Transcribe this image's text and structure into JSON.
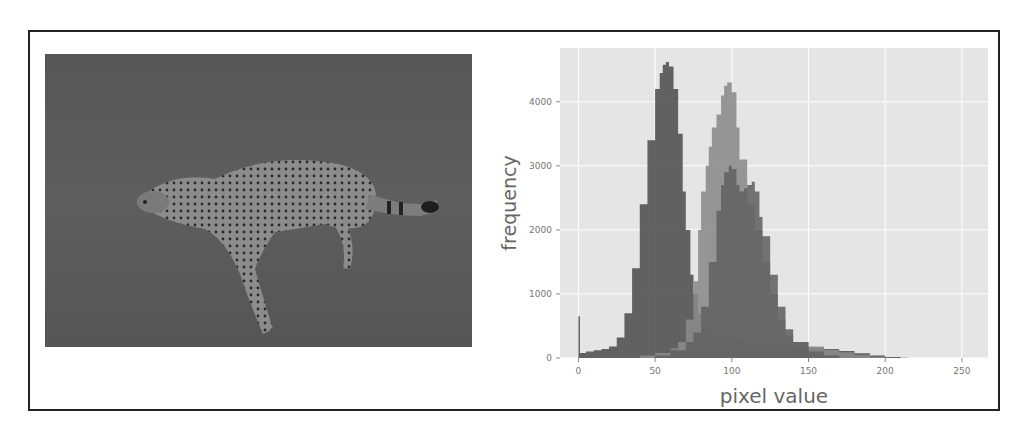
{
  "figure": {
    "left_panel": {
      "type": "photo",
      "subject": "cheetah running on grassland (grayscale)"
    },
    "right_panel": {
      "type": "histogram"
    }
  },
  "chart_data": {
    "type": "area",
    "title": "",
    "xlabel": "pixel value",
    "ylabel": "frequency",
    "xlim": [
      -12,
      267
    ],
    "ylim": [
      0,
      4840
    ],
    "xticks": [
      0,
      50,
      100,
      150,
      200,
      250
    ],
    "yticks": [
      0,
      1000,
      2000,
      3000,
      4000
    ],
    "grid": true,
    "legend": null,
    "background": "#e5e5e5",
    "series": [
      {
        "name": "channel-dark",
        "color": "#4e4e4e",
        "x": [
          0,
          1,
          5,
          10,
          15,
          20,
          25,
          30,
          35,
          40,
          45,
          50,
          53,
          55,
          57,
          59,
          62,
          65,
          68,
          70,
          73,
          75,
          78,
          80,
          85,
          90,
          95,
          100,
          110,
          120,
          130,
          140,
          150,
          160,
          170,
          180,
          190,
          200,
          210,
          215
        ],
        "values": [
          650,
          80,
          100,
          120,
          140,
          180,
          320,
          700,
          1400,
          2400,
          3400,
          4200,
          4450,
          4580,
          4620,
          4550,
          4200,
          3500,
          2600,
          2000,
          1300,
          1000,
          700,
          560,
          420,
          360,
          320,
          290,
          240,
          210,
          190,
          175,
          160,
          140,
          110,
          75,
          40,
          15,
          5,
          0
        ]
      },
      {
        "name": "channel-light",
        "color": "#8a8a8a",
        "x": [
          30,
          40,
          50,
          60,
          65,
          70,
          75,
          78,
          80,
          83,
          85,
          87,
          90,
          93,
          95,
          97,
          100,
          103,
          105,
          110,
          115,
          120,
          125,
          130,
          135,
          140,
          150,
          160,
          170,
          180,
          190,
          200
        ],
        "values": [
          0,
          40,
          80,
          150,
          250,
          600,
          1200,
          2000,
          2600,
          3000,
          3300,
          3600,
          3800,
          4100,
          4250,
          4300,
          4150,
          3600,
          3100,
          2400,
          2000,
          1500,
          1000,
          600,
          350,
          250,
          180,
          130,
          90,
          50,
          20,
          0
        ]
      },
      {
        "name": "channel-mid",
        "color": "#626262",
        "x": [
          40,
          50,
          60,
          70,
          75,
          80,
          85,
          90,
          93,
          95,
          98,
          100,
          103,
          105,
          108,
          110,
          113,
          115,
          118,
          120,
          125,
          130,
          135,
          140,
          150,
          160,
          170
        ],
        "values": [
          0,
          40,
          120,
          250,
          400,
          800,
          1500,
          2300,
          2700,
          2900,
          3000,
          2950,
          2700,
          2600,
          2650,
          2700,
          2750,
          2600,
          2200,
          1900,
          1300,
          800,
          450,
          250,
          100,
          40,
          0
        ]
      }
    ]
  }
}
